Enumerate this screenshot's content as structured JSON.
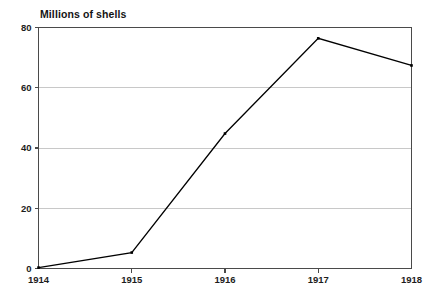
{
  "chart_data": {
    "type": "line",
    "title": "Millions of shells",
    "xlabel": "",
    "ylabel": "Millions of shells",
    "categories": [
      "1914",
      "1915",
      "1916",
      "1917",
      "1918"
    ],
    "x": [
      1914,
      1915,
      1916,
      1917,
      1918
    ],
    "values": [
      0.3,
      5.3,
      44.8,
      76.4,
      67.4
    ],
    "series": [
      {
        "name": "Millions of shells",
        "values": [
          0.3,
          5.3,
          44.8,
          76.4,
          67.4
        ]
      }
    ],
    "ylim": [
      0,
      80
    ],
    "y_ticks": [
      0,
      20,
      40,
      60,
      80
    ],
    "y_tick_labels": [
      "0",
      "20",
      "40",
      "60",
      "80"
    ],
    "x_tick_labels": [
      "1914",
      "1915",
      "1916",
      "1917",
      "1918"
    ],
    "grid": true,
    "grid_axis": "y",
    "legend": false,
    "legend_position": "none",
    "markers": "square",
    "line_color": "#000000",
    "grid_color": "#c8c8c8",
    "axis_color": "#4a4a4a",
    "background_color": "#ffffff"
  },
  "colors": {
    "line": "#000000",
    "grid": "#c8c8c8",
    "axis": "#4a4a4a",
    "text": "#1a1a1a",
    "background": "#ffffff"
  }
}
